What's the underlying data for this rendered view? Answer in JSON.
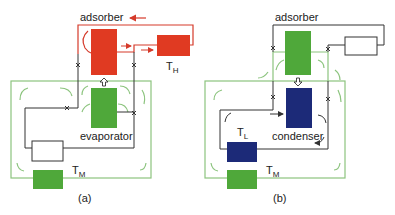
{
  "colors": {
    "hot": "#e03a22",
    "adsorbing": "#4fa83a",
    "cold": "#1c2a78",
    "loop_green": "#8cc47e",
    "line": "#333333",
    "flow_red": "#d53a2a"
  },
  "panels": [
    {
      "id": "a",
      "caption": "(a)",
      "top_label": "adsorber",
      "middle_label": "evaporator",
      "heat_source": {
        "label": "T",
        "sub": "H"
      },
      "sink": {
        "label": "T",
        "sub": "M"
      },
      "transfer_arrow": "up"
    },
    {
      "id": "b",
      "caption": "(b)",
      "top_label": "adsorber",
      "middle_label": "condenser",
      "low_reservoir": {
        "label": "T",
        "sub": "L"
      },
      "sink": {
        "label": "T",
        "sub": "M"
      },
      "transfer_arrow": "down"
    }
  ]
}
